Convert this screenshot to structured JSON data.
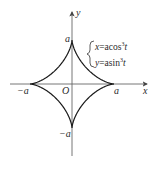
{
  "diagram": {
    "axes": {
      "x_label": "x",
      "y_label": "y",
      "origin_label": "O"
    },
    "tick_labels": {
      "right": "a",
      "left": "−a",
      "top": "a",
      "bottom": "−a"
    },
    "equations": {
      "x_lhs": "x",
      "x_rhs": "=acos",
      "x_exp": "3",
      "x_var": "t",
      "y_lhs": "y",
      "y_rhs": "=asin",
      "y_exp": "3",
      "y_var": "t"
    },
    "colors": {
      "curve": "#1a1a1a",
      "axis": "#555555",
      "text": "#2a2a2a"
    }
  }
}
